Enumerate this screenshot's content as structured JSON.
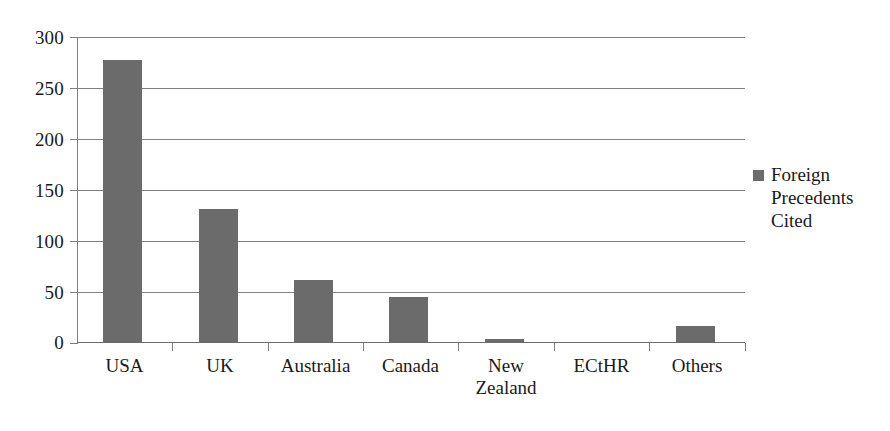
{
  "chart_data": {
    "type": "bar",
    "title": "",
    "subtitle": "",
    "xlabel": "",
    "ylabel": "",
    "categories": [
      "USA",
      "UK",
      "Australia",
      "Canada",
      "New Zealand",
      "ECtHR",
      "Others"
    ],
    "series": [
      {
        "name": "Foreign Precedents Cited",
        "values": [
          277,
          131,
          62,
          45,
          4,
          1,
          17
        ],
        "color": "#6b6b6b"
      }
    ],
    "ylim": [
      0,
      300
    ],
    "y_ticks": [
      0,
      50,
      100,
      150,
      200,
      250,
      300
    ],
    "y_tick_labels": [
      "0",
      "50",
      "100",
      "150",
      "200",
      "250",
      "300"
    ],
    "grid": "horizontal",
    "legend_position": "right",
    "legend_entries": [
      "Foreign Precedents Cited"
    ],
    "annotations": []
  },
  "legend": {
    "swatch_name": "legend-color-swatch",
    "label_line_1": "Foreign",
    "label_line_2": "Precedents",
    "label_line_3": "Cited",
    "label_full": "Foreign Precedents Cited"
  },
  "x_axis": {
    "labels": [
      {
        "line1": "USA",
        "line2": ""
      },
      {
        "line1": "UK",
        "line2": ""
      },
      {
        "line1": "Australia",
        "line2": ""
      },
      {
        "line1": "Canada",
        "line2": ""
      },
      {
        "line1": "New",
        "line2": "Zealand"
      },
      {
        "line1": "ECtHR",
        "line2": ""
      },
      {
        "line1": "Others",
        "line2": ""
      }
    ]
  },
  "colors": {
    "bar_fill": "#6b6b6b",
    "gridline": "#808080",
    "axis": "#808080",
    "text": "#1a1a1a",
    "background": "#ffffff"
  }
}
